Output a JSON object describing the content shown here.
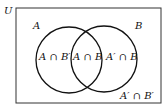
{
  "diagram": {
    "type": "venn",
    "universe_label": "U",
    "sets": [
      {
        "name": "A",
        "label": "A"
      },
      {
        "name": "B",
        "label": "B"
      }
    ],
    "regions": {
      "a_only": "A ∩ B′",
      "both": "A ∩ B",
      "b_only": "A′ ∩ B",
      "neither": "A′ ∩ B′"
    },
    "colors": {
      "stroke": "#111111",
      "background": "#ffffff"
    }
  }
}
